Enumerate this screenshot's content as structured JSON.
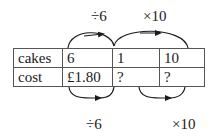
{
  "top_labels": {
    "first": "÷6",
    "second": "×10"
  },
  "bottom_labels": {
    "first": "÷6",
    "second": "×10"
  },
  "table": {
    "rows": [
      {
        "header": "cakes",
        "cells": [
          "6",
          "1",
          "10"
        ]
      },
      {
        "header": "cost",
        "cells": [
          "£1.80",
          "?",
          "?"
        ]
      }
    ]
  },
  "colors": {
    "line": "#1a1a1a",
    "border": "#555555"
  }
}
